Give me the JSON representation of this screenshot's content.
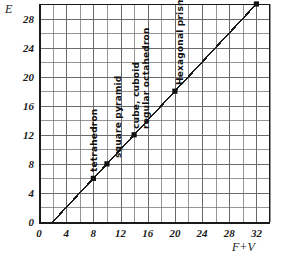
{
  "chart_data": {
    "type": "scatter",
    "title": "",
    "xlabel": "F+V",
    "ylabel": "E",
    "xlim": [
      0,
      34
    ],
    "ylim": [
      0,
      30
    ],
    "grid": true,
    "grid_step": 2,
    "legend": "none",
    "relationship": "E = F + V - 2",
    "x_ticks": [
      "0",
      "4",
      "8",
      "12",
      "16",
      "20",
      "24",
      "28",
      "32"
    ],
    "x_tick_values": [
      0,
      4,
      8,
      12,
      16,
      20,
      24,
      28,
      32
    ],
    "y_ticks": [
      "0",
      "4",
      "8",
      "12",
      "16",
      "20",
      "24",
      "28"
    ],
    "y_tick_values": [
      0,
      4,
      8,
      12,
      16,
      20,
      24,
      28
    ],
    "line": {
      "x_start": 2,
      "y_start": 0,
      "x_end": 32,
      "y_end": 30
    },
    "points": [
      {
        "label": "tetrahedron",
        "x": 8,
        "y": 6
      },
      {
        "label": "square pyramid",
        "x": 10,
        "y": 8
      },
      {
        "label": "cube, cuboid",
        "x": 14,
        "y": 12
      },
      {
        "label": "regular octahedron",
        "x": 14,
        "y": 12
      },
      {
        "label": "Hexagonal prism",
        "x": 20,
        "y": 18
      },
      {
        "label": "regular dodecahedron",
        "x": 32,
        "y": 30
      },
      {
        "label": "regular icosahedron",
        "x": 32,
        "y": 30
      }
    ],
    "colors": {
      "line": "#1a1a1a",
      "point": "#111111",
      "grid": "#6a6a6a",
      "axis": "#1a1a1a",
      "background": "#ffffff"
    }
  }
}
